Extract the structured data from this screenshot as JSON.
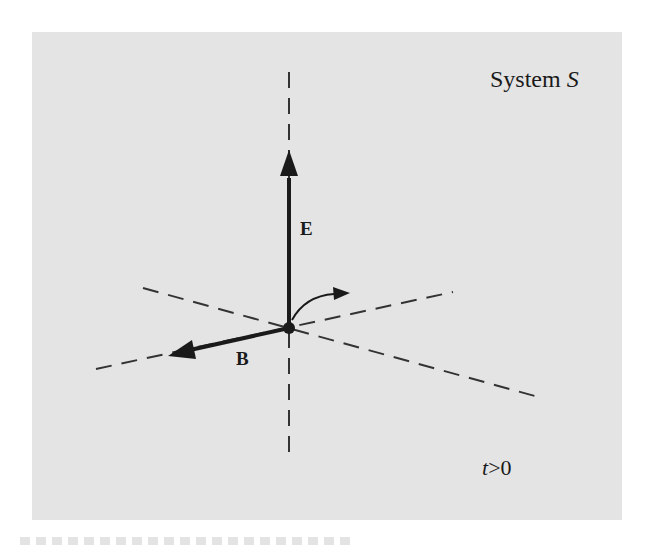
{
  "figure": {
    "title_prefix": "System",
    "title_symbol": "S",
    "vectors": {
      "electric_field_label": "E",
      "magnetic_field_label": "B"
    },
    "time_condition": {
      "variable": "t",
      "relation": ">0"
    },
    "colors": {
      "panel_background": "#e4e4e4",
      "ink": "#1a1a1a",
      "page_background": "#ffffff"
    }
  },
  "caption": {
    "visible": "partially cropped, illegible"
  }
}
